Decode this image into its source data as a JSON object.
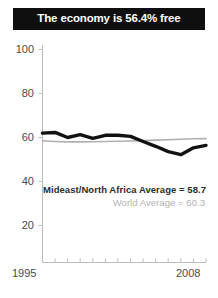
{
  "title": {
    "text": "The economy is 56.4% free"
  },
  "colors": {
    "banner_background": "#100f0f",
    "banner_text": "#ffffff",
    "primary_series": "#111111",
    "secondary_series": "#b0b0b0",
    "axis": "#b8b8b8",
    "tick_label": "#4a4a4a",
    "legend_primary": "#2d2d2d",
    "legend_secondary": "#b3b3b3",
    "background": "#ffffff"
  },
  "axes": {
    "y_ticks": [
      "100",
      "80",
      "60",
      "40",
      "20"
    ],
    "x_start_label": "1995",
    "x_end_label": "2008"
  },
  "legend": {
    "primary": "Mideast/North Africa Average = 58.7",
    "secondary": "World Average = 60.3"
  },
  "chart_data": {
    "type": "line",
    "title": "The economy is 56.4% free",
    "xlabel": "",
    "ylabel": "",
    "xlim": [
      1995,
      2008
    ],
    "ylim": [
      10,
      100
    ],
    "grid": false,
    "legend_position": "inside-center",
    "x": [
      1995,
      1996,
      1997,
      1998,
      1999,
      2000,
      2001,
      2002,
      2003,
      2004,
      2005,
      2006,
      2007,
      2008
    ],
    "categories": [
      "1995",
      "1996",
      "1997",
      "1998",
      "1999",
      "2000",
      "2001",
      "2002",
      "2003",
      "2004",
      "2005",
      "2006",
      "2007",
      "2008"
    ],
    "series": [
      {
        "name": "Mideast/North Africa Average",
        "color": "#111111",
        "linewidth": "thick",
        "average_label": "Mideast/North Africa Average = 58.7",
        "average": 58.7,
        "values": [
          62.0,
          62.3,
          60.0,
          61.3,
          59.6,
          61.0,
          61.0,
          60.5,
          58.2,
          56.0,
          53.6,
          52.2,
          55.3,
          56.4
        ]
      },
      {
        "name": "World Average",
        "color": "#b0b0b0",
        "linewidth": "thin",
        "average_label": "World Average = 60.3",
        "average": 60.3,
        "values": [
          58.5,
          58.2,
          58.0,
          58.0,
          58.1,
          58.2,
          58.3,
          58.4,
          58.6,
          58.8,
          59.0,
          59.2,
          59.4,
          59.5
        ]
      }
    ],
    "tick_values_y": [
      20,
      40,
      60,
      80,
      100
    ],
    "annotations": [
      {
        "text": "Mideast/North Africa Average = 58.7"
      },
      {
        "text": "World Average = 60.3"
      }
    ]
  }
}
